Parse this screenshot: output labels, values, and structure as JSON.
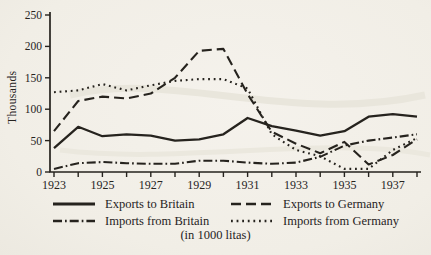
{
  "figure": {
    "paper_color": "#f2efe8",
    "ink_color": "#26231e",
    "y_axis_label": "Thousands",
    "caption": "(in 1000 litas)",
    "y_tick_labels": [
      "0",
      "50",
      "100",
      "150",
      "200",
      "250"
    ],
    "x_tick_labels": [
      "1923",
      "1925",
      "1927",
      "1929",
      "1931",
      "1933",
      "1935",
      "1937"
    ]
  },
  "chart_data": {
    "type": "line",
    "title": "",
    "xlabel": "",
    "ylabel": "Thousands",
    "caption": "(in 1000 litas)",
    "x": [
      1923,
      1924,
      1925,
      1926,
      1927,
      1928,
      1929,
      1930,
      1931,
      1932,
      1933,
      1934,
      1935,
      1936,
      1937,
      1938
    ],
    "ylim": [
      0,
      250
    ],
    "y_ticks": [
      0,
      50,
      100,
      150,
      200,
      250
    ],
    "grid": false,
    "legend_position": "bottom-two-columns",
    "series": [
      {
        "name": "Exports to Britain",
        "style": "solid",
        "values": [
          38,
          72,
          57,
          60,
          58,
          50,
          52,
          60,
          86,
          73,
          66,
          58,
          65,
          88,
          92,
          88
        ]
      },
      {
        "name": "Exports to Germany",
        "style": "dashed",
        "values": [
          65,
          113,
          120,
          117,
          125,
          150,
          193,
          196,
          124,
          64,
          45,
          30,
          48,
          12,
          27,
          52
        ]
      },
      {
        "name": "Imports from Britain",
        "style": "dashdot",
        "values": [
          5,
          14,
          16,
          14,
          13,
          13,
          18,
          18,
          15,
          13,
          15,
          24,
          42,
          50,
          55,
          60
        ]
      },
      {
        "name": "Imports from Germany",
        "style": "dotted",
        "values": [
          127,
          130,
          140,
          130,
          138,
          145,
          148,
          148,
          133,
          60,
          35,
          25,
          5,
          5,
          35,
          54
        ]
      }
    ]
  }
}
